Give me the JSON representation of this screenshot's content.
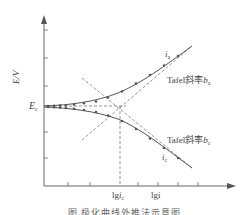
{
  "diagram": {
    "title": "极化曲线外推法示意图",
    "axes": {
      "y_label": "E/V",
      "x_label": "lgi",
      "x_marker_label_main": "lg",
      "x_marker_label_var": "i",
      "x_marker_label_sub": "c",
      "y_marker_label_main": "E",
      "y_marker_label_sub": "c"
    },
    "curves": {
      "anodic": {
        "label_var": "i",
        "label_sub": "a",
        "slope_text": "Tafel斜率",
        "slope_var": "b",
        "slope_sub": "a"
      },
      "cathodic": {
        "label_var": "i",
        "label_sub": "c",
        "slope_text": "Tafel斜率",
        "slope_var": "b",
        "slope_sub": "c"
      }
    },
    "caption": "图      极化曲线外推法示意图",
    "colors": {
      "line": "#555555",
      "dashed": "#777777",
      "marker": "#555555"
    }
  }
}
